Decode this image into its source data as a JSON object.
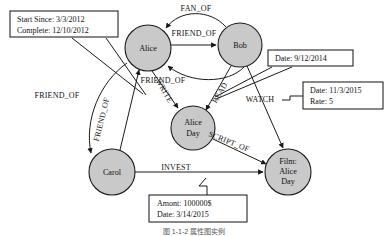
{
  "figure": {
    "type": "property-graph-diagram",
    "caption": "图 1-1-2  属性图实例"
  },
  "nodes": [
    {
      "id": "alice",
      "label": "Alice",
      "lines": [
        "Alice"
      ],
      "cx": 148,
      "cy": 48,
      "r": 23
    },
    {
      "id": "bob",
      "label": "Bob",
      "lines": [
        "Bob"
      ],
      "cx": 240,
      "cy": 45,
      "r": 22
    },
    {
      "id": "aliceday",
      "label": "Alice Day",
      "lines": [
        "Alice",
        "Day"
      ],
      "cx": 193,
      "cy": 128,
      "r": 22
    },
    {
      "id": "carol",
      "label": "Carol",
      "lines": [
        "Carol"
      ],
      "cx": 112,
      "cy": 172,
      "r": 23
    },
    {
      "id": "film",
      "label": "Film: Alice Day",
      "lines": [
        "Film:",
        "Alice",
        "Day"
      ],
      "cx": 288,
      "cy": 172,
      "r": 23
    }
  ],
  "edges": [
    {
      "id": "fan_of",
      "label": "FAN_OF",
      "from": "bob",
      "to": "alice",
      "label_x": 196,
      "label_y": 11,
      "rotate": 0
    },
    {
      "id": "friend_of_1",
      "label": "FRIEND_OF",
      "from": "alice",
      "to": "bob",
      "label_x": 194,
      "label_y": 36,
      "rotate": 0
    },
    {
      "id": "friend_of_2",
      "label": "FRIEND_OF",
      "from": "bob",
      "to": "alice",
      "label_x": 163,
      "label_y": 83,
      "rotate": 0
    },
    {
      "id": "friend_of_3",
      "label": "FRIEND_OF",
      "from": "alice",
      "to": "carol",
      "label_x": 24,
      "label_y": 98,
      "rotate": 0
    },
    {
      "id": "friend_of_4",
      "label": "FRIEND_OF",
      "from": "carol",
      "to": "alice",
      "label_x": 104,
      "label_y": 120,
      "rotate": -72
    },
    {
      "id": "write",
      "label": "WRITE",
      "from": "alice",
      "to": "aliceday",
      "label_x": 160,
      "label_y": 92,
      "rotate": 62
    },
    {
      "id": "read",
      "label": "READ",
      "from": "bob",
      "to": "aliceday",
      "label_x": 222,
      "label_y": 92,
      "rotate": -62
    },
    {
      "id": "script_of",
      "label": "SCRIPT_OF",
      "from": "aliceday",
      "to": "film",
      "label_x": 226,
      "label_y": 146,
      "rotate": 22
    },
    {
      "id": "watch",
      "label": "WATCH",
      "from": "bob",
      "to": "film",
      "label_x": 259,
      "label_y": 102,
      "rotate": 0
    },
    {
      "id": "invest",
      "label": "INVEST",
      "from": "carol",
      "to": "film",
      "label_x": 175,
      "label_y": 172,
      "rotate": 0
    }
  ],
  "property_boxes": [
    {
      "id": "friend_of_props",
      "x": 10,
      "y": 11,
      "w": 108,
      "h": 26,
      "lines": [
        "Start Since: 3/3/2012",
        "Complete: 12/10/2012"
      ]
    },
    {
      "id": "read_props",
      "x": 268,
      "y": 50,
      "w": 85,
      "h": 16,
      "lines": [
        "Date: 9/12/2014"
      ]
    },
    {
      "id": "watch_props",
      "x": 303,
      "y": 82,
      "w": 80,
      "h": 27,
      "lines": [
        "Date: 11/3/2015",
        "Rate: 5"
      ]
    },
    {
      "id": "invest_props",
      "x": 149,
      "y": 195,
      "w": 98,
      "h": 27,
      "lines": [
        "Amont: 100000$",
        "Date: 3/14/2015"
      ]
    }
  ],
  "colors": {
    "node_fill": "#c9c9c9",
    "stroke": "#1a1a1a",
    "box_fill": "#ffffff",
    "background": "#ffffff"
  }
}
